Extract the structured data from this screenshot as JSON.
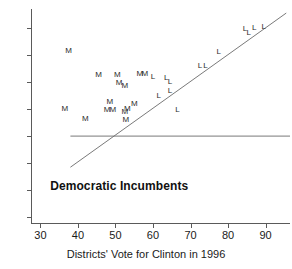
{
  "chart_data": {
    "type": "scatter",
    "title": "",
    "xlabel": "Districts' Vote for Clinton in 1996",
    "ylabel": "",
    "xlim": [
      27.5,
      96.5
    ],
    "ylim": [
      17.5,
      97.0
    ],
    "xticks": [
      30,
      40,
      50,
      60,
      70,
      80,
      90
    ],
    "yticks": [
      20,
      30,
      40,
      50,
      60,
      70,
      80,
      90
    ],
    "grid": false,
    "legend": "none",
    "annotations": [
      {
        "text": "Democratic Incumbents",
        "x": 51,
        "y": 31.5,
        "bold": true
      }
    ],
    "reference_lines": [
      {
        "name": "fifty-percent-line",
        "type": "horizontal",
        "y": 50,
        "x_start": 38.0,
        "x_end": 96.5
      },
      {
        "name": "regression-line",
        "type": "linear",
        "x_start": 38.0,
        "y_start": 38.5,
        "x_end": 95.5,
        "y_end": 95.5
      }
    ],
    "series": [
      {
        "name": "Moderate Democrats",
        "marker": "M",
        "points": [
          {
            "x": 37.5,
            "y": 81.5
          },
          {
            "x": 45.5,
            "y": 72.5
          },
          {
            "x": 50.5,
            "y": 72.5
          },
          {
            "x": 51.0,
            "y": 69.5
          },
          {
            "x": 52.5,
            "y": 68.5
          },
          {
            "x": 56.5,
            "y": 72.8
          },
          {
            "x": 57.8,
            "y": 73.0
          },
          {
            "x": 36.5,
            "y": 60.0
          },
          {
            "x": 42.0,
            "y": 56.5
          },
          {
            "x": 48.5,
            "y": 62.5
          },
          {
            "x": 47.8,
            "y": 59.5
          },
          {
            "x": 49.3,
            "y": 59.5
          },
          {
            "x": 52.5,
            "y": 59.0
          },
          {
            "x": 53.2,
            "y": 60.0
          },
          {
            "x": 52.8,
            "y": 56.0
          },
          {
            "x": 55.0,
            "y": 62.0
          }
        ]
      },
      {
        "name": "Liberal Democrats",
        "marker": "L",
        "points": [
          {
            "x": 60.0,
            "y": 72.0
          },
          {
            "x": 63.5,
            "y": 71.5
          },
          {
            "x": 64.5,
            "y": 70.0
          },
          {
            "x": 64.5,
            "y": 66.5
          },
          {
            "x": 61.5,
            "y": 65.0
          },
          {
            "x": 66.5,
            "y": 59.5
          },
          {
            "x": 72.5,
            "y": 76.0
          },
          {
            "x": 74.0,
            "y": 76.0
          },
          {
            "x": 77.5,
            "y": 81.0
          },
          {
            "x": 84.5,
            "y": 89.5
          },
          {
            "x": 85.5,
            "y": 88.0
          },
          {
            "x": 87.0,
            "y": 90.0
          },
          {
            "x": 89.5,
            "y": 90.5
          }
        ]
      }
    ]
  },
  "axis": {
    "x_title": "Districts' Vote for Clinton in 1996",
    "x_tick_labels": [
      "30",
      "40",
      "50",
      "60",
      "70",
      "80",
      "90"
    ],
    "y_tick_labels": [
      "20",
      "30",
      "40",
      "50",
      "60",
      "70",
      "80",
      "90"
    ]
  },
  "colors": {
    "axis": "#5a5a5a",
    "marker": "#2b2b2b",
    "annotation": "#111111",
    "line": "#6a6a6a",
    "background": "#ffffff"
  }
}
